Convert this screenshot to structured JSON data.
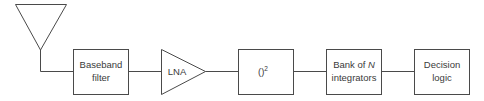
{
  "diagram": {
    "type": "block-diagram",
    "direction": "left-to-right",
    "blocks": [
      {
        "id": "antenna",
        "shape": "inverted-triangle",
        "label": ""
      },
      {
        "id": "baseband-filter",
        "shape": "rectangle",
        "label_line1": "Baseband",
        "label_line2": "filter"
      },
      {
        "id": "lna",
        "shape": "triangle-amplifier",
        "label": "LNA"
      },
      {
        "id": "square-law",
        "shape": "rectangle",
        "label": "()",
        "superscript": "2"
      },
      {
        "id": "integrator-bank",
        "shape": "rectangle",
        "label_line1_prefix": "Bank of ",
        "label_line1_var": "N",
        "label_line2": "integrators"
      },
      {
        "id": "decision-logic",
        "shape": "rectangle",
        "label_line1": "Decision",
        "label_line2": "logic"
      }
    ],
    "connections": [
      [
        "antenna",
        "baseband-filter"
      ],
      [
        "baseband-filter",
        "lna"
      ],
      [
        "lna",
        "square-law"
      ],
      [
        "square-law",
        "integrator-bank"
      ],
      [
        "integrator-bank",
        "decision-logic"
      ]
    ],
    "colors": {
      "line": "#4a4a4a",
      "text": "#3a3a3a",
      "background": "#ffffff"
    }
  }
}
